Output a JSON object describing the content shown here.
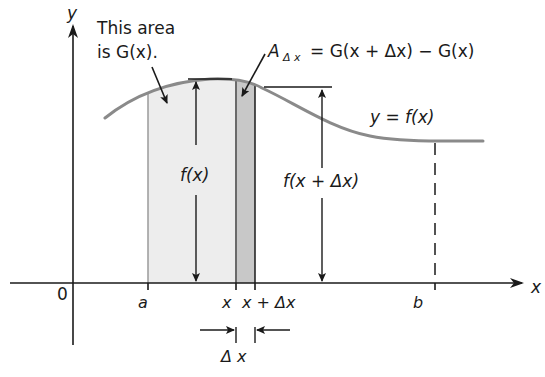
{
  "figure": {
    "type": "area-under-curve-diagram",
    "axes": {
      "y_label": "y",
      "x_label": "x",
      "origin_label": "0"
    },
    "curve_label": "y = f(x)",
    "ticks": {
      "a": "a",
      "x": "x",
      "x_plus_dx": "x + Δx",
      "b": "b"
    },
    "annotations": {
      "area_note_line1": "This area",
      "area_note_line2": "is G(x).",
      "strip_formula_A": "A",
      "strip_formula_sub": "Δ x",
      "strip_formula_rhs": "= G(x + Δx) − G(x)",
      "height_fx": "f(x)",
      "height_fx_dx": "f(x + Δx)",
      "delta_x": "Δ x"
    },
    "colors": {
      "axis": "#1a1a1a",
      "curve": "#8a8a8a",
      "area_light": "#ededed",
      "strip_dark": "#c8c8c8",
      "background": "#ffffff"
    }
  }
}
